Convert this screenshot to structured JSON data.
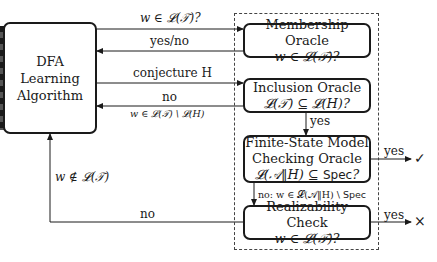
{
  "learner": {
    "title_line1": "DFA Learning",
    "title_line2": "Algorithm"
  },
  "oracles": [
    {
      "id": "membership",
      "title": "Membership Oracle",
      "query": "w ∈ 𝓛(𝒯)?"
    },
    {
      "id": "inclusion",
      "title": "Inclusion Oracle",
      "query": "𝓛(𝒯) ⊆ 𝓛(H)?"
    },
    {
      "id": "model-checking",
      "title_line1": "Finite-State Model",
      "title_line2": "Checking Oracle",
      "query_prefix": "𝓛(𝒜‖H) ⊆ ",
      "query_spec": "Spec",
      "query_suffix": "?"
    },
    {
      "id": "realizability",
      "title": "Realizability Check",
      "query": "w ∈ 𝓛(𝒯)?"
    }
  ],
  "edges": {
    "membership_query": "w ∈ 𝓛(𝒯)?",
    "membership_answer": "yes/no",
    "conjecture": "conjecture H",
    "inclusion_no": "no",
    "inclusion_counterexample": "w ∈ 𝓛(𝒯) \\ 𝓛(H)",
    "inclusion_yes": "yes",
    "mc_yes": "yes",
    "mc_no_prefix": "no: w ∈ 𝓛(𝒜‖H) \\ ",
    "mc_no_spec": "Spec",
    "realizability_yes": "yes",
    "realizability_no": "no",
    "feedback_not_in": "w ∉ 𝓛(𝒯)"
  },
  "results": {
    "success_symbol": "✓",
    "failure_symbol": "×"
  },
  "colors": {
    "stroke": "#1a1a1a",
    "dashed": "#444444",
    "background": "#ffffff"
  }
}
